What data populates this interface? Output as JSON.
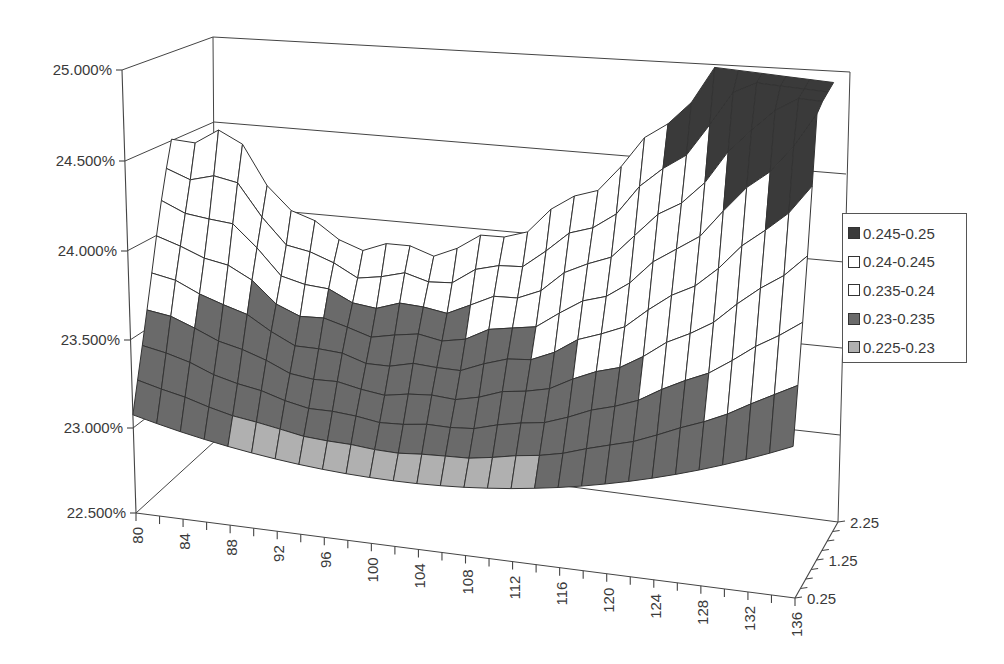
{
  "chart_data": {
    "type": "surface",
    "title": "",
    "xlabel": "",
    "ylabel": "",
    "zlabel": "",
    "z_axis": {
      "tick_labels": [
        "22.500%",
        "23.000%",
        "23.500%",
        "24.000%",
        "24.500%",
        "25.000%"
      ],
      "range": [
        0.225,
        0.25
      ]
    },
    "x_axis": {
      "tick_labels": [
        "80",
        "84",
        "88",
        "92",
        "96",
        "100",
        "104",
        "108",
        "112",
        "116",
        "120",
        "124",
        "128",
        "132",
        "136"
      ],
      "values": [
        80,
        82,
        84,
        86,
        88,
        90,
        92,
        94,
        96,
        98,
        100,
        102,
        104,
        106,
        108,
        110,
        112,
        114,
        116,
        118,
        120,
        122,
        124,
        126,
        128,
        130,
        132,
        134,
        136
      ]
    },
    "depth_axis": {
      "tick_labels": [
        "0.25",
        "1.25",
        "2.25"
      ],
      "values": [
        0.25,
        0.5,
        0.75,
        1.0,
        1.25,
        1.5,
        1.75,
        2.0,
        2.25
      ]
    },
    "legend": {
      "position": "right",
      "entries": [
        {
          "label": "0.245-0.25",
          "color": "#3a3a3a"
        },
        {
          "label": "0.24-0.245",
          "color": "#ffffff"
        },
        {
          "label": "0.235-0.24",
          "color": "#ffffff"
        },
        {
          "label": "0.23-0.235",
          "color": "#6a6a6a"
        },
        {
          "label": "0.225-0.23",
          "color": "#b0b0b0"
        }
      ]
    },
    "grid": true,
    "surface_shape": "U-shaped valley: minimum ~22.9% near strike 100-104 at short maturity; rises to ~24.3% at 84 (long maturity) and ~24.9% at 136 (long maturity)",
    "approx_values_by_depth": [
      {
        "depth": 0.25,
        "z_at": {
          "80": 0.2325,
          "92": 0.2292,
          "104": 0.2286,
          "116": 0.2298,
          "128": 0.2315,
          "136": 0.233
        }
      },
      {
        "depth": 1.25,
        "z_at": {
          "80": 0.2345,
          "92": 0.232,
          "104": 0.2312,
          "116": 0.2325,
          "128": 0.236,
          "136": 0.239
        }
      },
      {
        "depth": 2.25,
        "z_at": {
          "80": 0.238,
          "84": 0.243,
          "92": 0.2395,
          "104": 0.2375,
          "116": 0.2395,
          "128": 0.244,
          "136": 0.249
        }
      }
    ]
  }
}
